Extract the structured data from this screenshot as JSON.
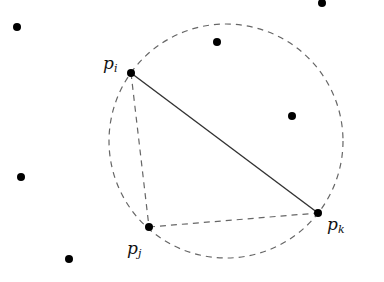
{
  "diagram": {
    "type": "delaunay-empty-circle",
    "colors": {
      "point": "#000000",
      "solid_edge": "#333333",
      "dashed": "#666666",
      "label": "#111111"
    },
    "circle": {
      "cx": 226,
      "cy": 141,
      "r": 117
    },
    "labeled_points": [
      {
        "id": "pi",
        "label": "p",
        "subscript": "i",
        "x": 131,
        "y": 73,
        "lx": 103,
        "ly": 69
      },
      {
        "id": "pj",
        "label": "p",
        "subscript": "j",
        "x": 149,
        "y": 227,
        "lx": 127,
        "ly": 254
      },
      {
        "id": "pk",
        "label": "p",
        "subscript": "k",
        "x": 318,
        "y": 213,
        "lx": 327,
        "ly": 230
      }
    ],
    "other_points": [
      {
        "x": 17,
        "y": 27
      },
      {
        "x": 322,
        "y": 3
      },
      {
        "x": 217,
        "y": 42
      },
      {
        "x": 292,
        "y": 116
      },
      {
        "x": 21,
        "y": 177
      },
      {
        "x": 69,
        "y": 259
      }
    ],
    "edges": [
      {
        "from": "pi",
        "to": "pk",
        "style": "solid"
      },
      {
        "from": "pi",
        "to": "pj",
        "style": "dashed"
      },
      {
        "from": "pj",
        "to": "pk",
        "style": "dashed"
      }
    ]
  }
}
